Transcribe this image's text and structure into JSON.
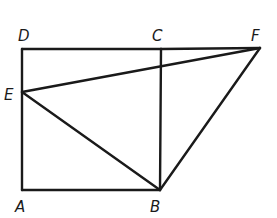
{
  "diagram": {
    "type": "geometry",
    "points": {
      "A": {
        "label": "A",
        "x": 22,
        "y": 190,
        "lx": 15,
        "ly": 212
      },
      "B": {
        "label": "B",
        "x": 160,
        "y": 190,
        "lx": 150,
        "ly": 212
      },
      "C": {
        "label": "C",
        "x": 161,
        "y": 49,
        "lx": 152,
        "ly": 41
      },
      "D": {
        "label": "D",
        "x": 22,
        "y": 49,
        "lx": 18,
        "ly": 41
      },
      "E": {
        "label": "E",
        "x": 22,
        "y": 92,
        "lx": 4,
        "ly": 100
      },
      "F": {
        "label": "F",
        "x": 260,
        "y": 48,
        "lx": 251,
        "ly": 41
      }
    },
    "segments": [
      {
        "name": "segment-AB",
        "from": "A",
        "to": "B"
      },
      {
        "name": "segment-BC",
        "from": "B",
        "to": "C"
      },
      {
        "name": "segment-DC",
        "from": "D",
        "to": "C"
      },
      {
        "name": "segment-CF",
        "from": "C",
        "to": "F"
      },
      {
        "name": "segment-AD",
        "from": "A",
        "to": "D"
      },
      {
        "name": "segment-EF",
        "from": "E",
        "to": "F"
      },
      {
        "name": "segment-EB",
        "from": "E",
        "to": "B"
      },
      {
        "name": "segment-BF",
        "from": "B",
        "to": "F"
      }
    ]
  }
}
